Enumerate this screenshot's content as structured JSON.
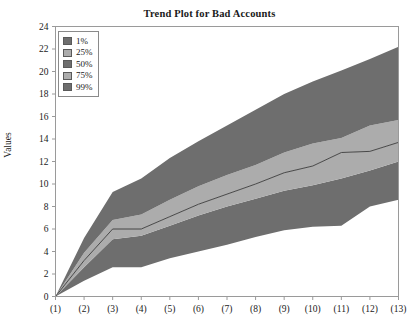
{
  "chart_data": {
    "type": "area",
    "title": "Trend Plot for Bad Accounts",
    "xlabel": "",
    "ylabel": "Values",
    "categories": [
      "(1)",
      "(2)",
      "(3)",
      "(4)",
      "(5)",
      "(6)",
      "(7)",
      "(8)",
      "(9)",
      "(10)",
      "(11)",
      "(12)",
      "(13)"
    ],
    "x": [
      1,
      2,
      3,
      4,
      5,
      6,
      7,
      8,
      9,
      10,
      11,
      12,
      13
    ],
    "ylim": [
      0,
      24
    ],
    "xlim": [
      1,
      13
    ],
    "ytick_labels": [
      "0",
      "2",
      "4",
      "6",
      "8",
      "10",
      "12",
      "14",
      "16",
      "18",
      "20",
      "22",
      "24"
    ],
    "ytick_values": [
      0,
      2,
      4,
      6,
      8,
      10,
      12,
      14,
      16,
      18,
      20,
      22,
      24
    ],
    "grid": false,
    "legend_position": "upper-left",
    "series": [
      {
        "name": "1%",
        "color": "#6e6e6e",
        "values": [
          0,
          1.4,
          2.6,
          2.6,
          3.4,
          4.0,
          4.6,
          5.3,
          5.9,
          6.2,
          6.3,
          8.0,
          8.6
        ]
      },
      {
        "name": "25%",
        "color": "#acacac",
        "values": [
          0,
          2.6,
          5.1,
          5.4,
          6.3,
          7.2,
          8.0,
          8.7,
          9.4,
          9.9,
          10.5,
          11.2,
          12.0
        ]
      },
      {
        "name": "50%",
        "color": "#6e6e6e",
        "values": [
          0,
          3.2,
          6.0,
          6.0,
          7.1,
          8.2,
          9.1,
          10.0,
          11.0,
          11.6,
          12.8,
          12.9,
          13.7
        ]
      },
      {
        "name": "75%",
        "color": "#acacac",
        "values": [
          0,
          3.9,
          6.8,
          7.3,
          8.6,
          9.8,
          10.8,
          11.7,
          12.8,
          13.6,
          14.1,
          15.2,
          15.7
        ]
      },
      {
        "name": "99%",
        "color": "#6e6e6e",
        "values": [
          0,
          5.2,
          9.3,
          10.5,
          12.3,
          13.8,
          15.2,
          16.6,
          18.0,
          19.1,
          20.1,
          21.1,
          22.2
        ]
      }
    ]
  },
  "legend": {
    "items": [
      {
        "label": "1%",
        "color": "#6e6e6e"
      },
      {
        "label": "25%",
        "color": "#acacac"
      },
      {
        "label": "50%",
        "color": "#6e6e6e"
      },
      {
        "label": "75%",
        "color": "#acacac"
      },
      {
        "label": "99%",
        "color": "#6e6e6e"
      }
    ]
  },
  "colors": {
    "band_dark": "#6e6e6e",
    "band_light": "#acacac",
    "median_line": "#3a3a3a",
    "axis": "#9a9a9a",
    "text": "#1a1a1a"
  }
}
